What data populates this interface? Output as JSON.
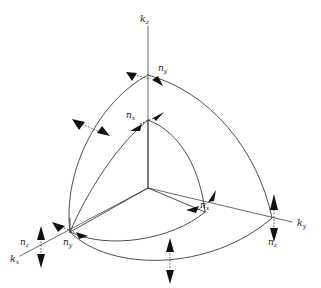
{
  "figure": {
    "background_color": "#ffffff",
    "line_color": "#3a3a3a",
    "axis_color": "#6b6b6b",
    "arrow_color": "#111111",
    "label_color": "#1b1b1b",
    "width": 321,
    "height": 288
  },
  "axes": [
    {
      "id": "kz",
      "label_base": "k",
      "label_sub": "z",
      "direction": "up",
      "label_x": 140,
      "label_y": 22,
      "from": {
        "x": 148,
        "y": 188
      },
      "to": {
        "x": 148,
        "y": 26
      }
    },
    {
      "id": "ky",
      "label_base": "k",
      "label_sub": "y",
      "direction": "right-down",
      "label_x": 297,
      "label_y": 226,
      "from": {
        "x": 148,
        "y": 188
      },
      "to": {
        "x": 292,
        "y": 222
      }
    },
    {
      "id": "kx",
      "label_base": "k",
      "label_sub": "x",
      "direction": "left-down",
      "label_x": 10,
      "label_y": 262,
      "from": {
        "x": 148,
        "y": 188
      },
      "to": {
        "x": 20,
        "y": 256
      }
    }
  ],
  "normal_labels": [
    {
      "id": "ny-top",
      "base": "n",
      "sub": "y",
      "x": 158,
      "y": 71,
      "note": "outer arc crossing kz axis"
    },
    {
      "id": "nx-mid",
      "base": "n",
      "sub": "x",
      "x": 126,
      "y": 118,
      "note": "inner arc crossing kz axis"
    },
    {
      "id": "nx-right",
      "base": "n",
      "sub": "x",
      "x": 200,
      "y": 208,
      "note": "inner arc crossing ky axis"
    },
    {
      "id": "ny-left",
      "base": "n",
      "sub": "y",
      "x": 63,
      "y": 245,
      "note": "inner arc crossing kx axis"
    },
    {
      "id": "nz-left",
      "base": "n",
      "sub": "z",
      "x": 20,
      "y": 245,
      "note": "outer arc crossing kx axis"
    },
    {
      "id": "nz-right",
      "base": "n",
      "sub": "z",
      "x": 268,
      "y": 245,
      "note": "outer arc crossing ky axis"
    }
  ],
  "geometry": {
    "origin": {
      "x": 148,
      "y": 188
    },
    "outer_radius_note": "outer spherical wedge, kz intercept y=75, kx intercept (70,232), ky intercept (272,218)",
    "inner_radius_note": "inner spherical wedge, kz intercept y=120, kx intercept (70,232), ky intercept (205,212)"
  },
  "annotations": {
    "unlabeled_dashed_arrow_upper_left": "dashed double arrow crossing outer arc, upper-left",
    "unlabeled_dashed_arrow_bottom": "vertical dashed double arrow crossing bottom outer arc"
  }
}
